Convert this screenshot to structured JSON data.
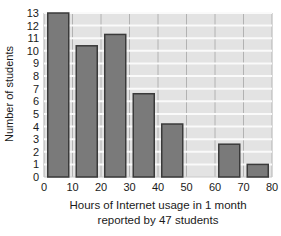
{
  "figure": {
    "x_axis_title_line1": "Hours of Internet usage in 1 month",
    "x_axis_title_line2": "reported by 47 students"
  },
  "chart_data": {
    "type": "bar",
    "title": "",
    "xlabel": "Hours of Internet usage in 1 month reported by 47 students",
    "ylabel": "Number of students",
    "categories": [
      "0-10",
      "10-20",
      "20-30",
      "30-40",
      "40-50",
      "50-60",
      "60-70",
      "70-80"
    ],
    "bin_centers": [
      5,
      15,
      25,
      35,
      45,
      55,
      65,
      75
    ],
    "bin_width": 10,
    "values": [
      13,
      10.4,
      11.3,
      6.6,
      4.2,
      0,
      2.6,
      1
    ],
    "x_ticks": [
      0,
      10,
      20,
      30,
      40,
      50,
      60,
      70,
      80
    ],
    "y_ticks": [
      0,
      1,
      2,
      3,
      4,
      5,
      6,
      7,
      8,
      9,
      10,
      11,
      12,
      13
    ],
    "xlim": [
      0,
      80
    ],
    "ylim": [
      0,
      13
    ],
    "grid": true,
    "legend": "none",
    "style": {
      "bar_fill": "#7a7a7a",
      "bar_border": "#3a3a3a",
      "plot_bg": "#e3e3e3",
      "h_gridline": "#fafafa",
      "v_gridline": "#b2b2b2",
      "plot_edge": "#c8c8c8",
      "text_color": "#1a1a1a"
    }
  }
}
